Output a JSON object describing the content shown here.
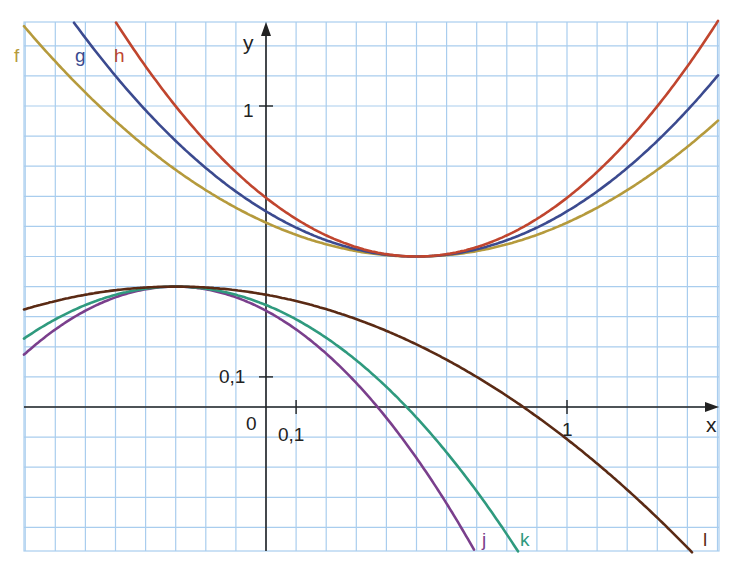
{
  "chart_data": {
    "type": "line",
    "title": "",
    "xlabel": "x",
    "ylabel": "y",
    "xlim": [
      -0.8,
      1.5
    ],
    "ylim": [
      -0.48,
      1.28
    ],
    "grid": true,
    "grid_step": 0.1,
    "ticks": {
      "x": [
        {
          "value": 0.1,
          "label": "0,1"
        },
        {
          "value": 1,
          "label": "1"
        }
      ],
      "y": [
        {
          "value": 0.1,
          "label": "0,1"
        },
        {
          "value": 1,
          "label": "1"
        }
      ],
      "origin_label": "0"
    },
    "series": [
      {
        "name": "f",
        "color": "#b59a3c",
        "form": "y = a(x-0.5)^2 + 0.5",
        "a": 0.45,
        "vertex": [
          0.5,
          0.5
        ]
      },
      {
        "name": "g",
        "color": "#3b4a8f",
        "form": "y = a(x-0.5)^2 + 0.5",
        "a": 0.6,
        "vertex": [
          0.5,
          0.5
        ]
      },
      {
        "name": "h",
        "color": "#c0452e",
        "form": "y = a(x-0.5)^2 + 0.5",
        "a": 0.78,
        "vertex": [
          0.5,
          0.5
        ]
      },
      {
        "name": "j",
        "color": "#7a3f8c",
        "form": "y = -a(x+0.3)^2 + 0.4",
        "a": 0.89,
        "vertex": [
          -0.3,
          0.4
        ]
      },
      {
        "name": "k",
        "color": "#2f9a7e",
        "form": "y = -a(x+0.3)^2 + 0.4",
        "a": 0.68,
        "vertex": [
          -0.3,
          0.4
        ]
      },
      {
        "name": "l",
        "color": "#5a2a14",
        "form": "y = -a(x+0.3)^2 + 0.4",
        "a": 0.3,
        "vertex": [
          -0.3,
          0.4
        ]
      }
    ]
  },
  "labels": {
    "f": "f",
    "g": "g",
    "h": "h",
    "j": "j",
    "k": "k",
    "l": "l",
    "x_axis": "x",
    "y_axis": "y",
    "origin": "0",
    "x_tick_01": "0,1",
    "x_tick_1": "1",
    "y_tick_01": "0,1",
    "y_tick_1": "1"
  }
}
